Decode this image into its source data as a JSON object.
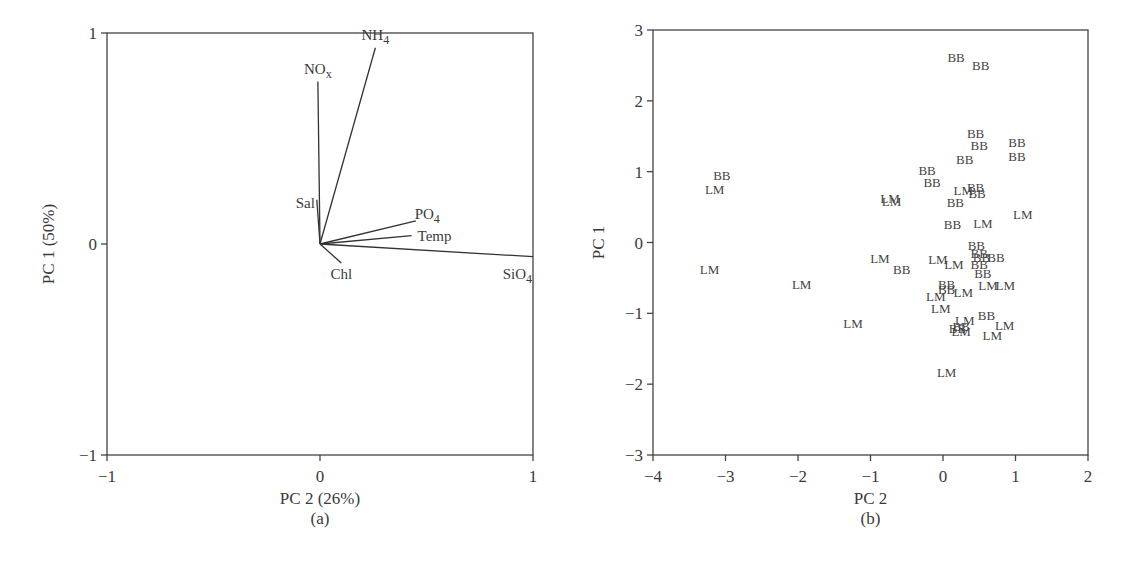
{
  "chart_data": [
    {
      "type": "biplot",
      "panel_label": "(a)",
      "xlabel": "PC 2 (26%)",
      "ylabel": "PC 1 (50%)",
      "xlim": [
        -1,
        1
      ],
      "ylim": [
        -1,
        1
      ],
      "xticks": [
        "-1",
        "0",
        "1"
      ],
      "yticks": [
        "1",
        "0",
        "-1"
      ],
      "grid": false,
      "legend": null,
      "vectors": [
        {
          "name": "NH4",
          "label": "NH",
          "sub": "4",
          "x": 0.26,
          "y": 0.93
        },
        {
          "name": "NOx",
          "label": "NO",
          "sub": "x",
          "x": -0.01,
          "y": 0.77
        },
        {
          "name": "Sal",
          "label": "Sal",
          "sub": "",
          "x": -0.015,
          "y": 0.21
        },
        {
          "name": "PO4",
          "label": "PO",
          "sub": "4",
          "x": 0.45,
          "y": 0.11
        },
        {
          "name": "Temp",
          "label": "Temp",
          "sub": "",
          "x": 0.43,
          "y": 0.04
        },
        {
          "name": "SiO4",
          "label": "SiO",
          "sub": "4",
          "x": 1.0,
          "y": -0.06
        },
        {
          "name": "Chl",
          "label": "Chl",
          "sub": "",
          "x": 0.1,
          "y": -0.09
        }
      ]
    },
    {
      "type": "scatter",
      "panel_label": "(b)",
      "xlabel": "PC 2",
      "ylabel": "PC 1",
      "xlim": [
        -4,
        2
      ],
      "ylim": [
        -3,
        3
      ],
      "xticks": [
        "-4",
        "-3",
        "-2",
        "-1",
        "0",
        "1",
        "2"
      ],
      "yticks": [
        "3",
        "2",
        "1",
        "0",
        "-1",
        "-2",
        "-3"
      ],
      "grid": false,
      "marker": "text-label",
      "series": [
        {
          "name": "BB",
          "points": [
            [
              0.18,
              2.62
            ],
            [
              0.52,
              2.5
            ],
            [
              0.45,
              1.55
            ],
            [
              0.5,
              1.38
            ],
            [
              1.02,
              1.42
            ],
            [
              1.02,
              1.22
            ],
            [
              0.3,
              1.18
            ],
            [
              -0.22,
              1.03
            ],
            [
              -0.15,
              0.85
            ],
            [
              0.45,
              0.78
            ],
            [
              0.47,
              0.7
            ],
            [
              0.17,
              0.57
            ],
            [
              -3.05,
              0.95
            ],
            [
              0.13,
              0.26
            ],
            [
              0.46,
              -0.03
            ],
            [
              0.5,
              -0.15
            ],
            [
              0.53,
              -0.2
            ],
            [
              0.73,
              -0.2
            ],
            [
              0.5,
              -0.3
            ],
            [
              0.55,
              -0.43
            ],
            [
              -0.57,
              -0.37
            ],
            [
              0.05,
              -0.58
            ],
            [
              0.05,
              -0.65
            ],
            [
              0.6,
              -1.02
            ],
            [
              0.25,
              -1.18
            ],
            [
              0.2,
              -1.2
            ]
          ]
        },
        {
          "name": "LM",
          "points": [
            [
              -3.15,
              0.75
            ],
            [
              -0.73,
              0.63
            ],
            [
              -0.71,
              0.58
            ],
            [
              0.28,
              0.74
            ],
            [
              0.55,
              0.28
            ],
            [
              1.1,
              0.4
            ],
            [
              -3.22,
              -0.37
            ],
            [
              -1.95,
              -0.58
            ],
            [
              -0.87,
              -0.22
            ],
            [
              -0.07,
              -0.23
            ],
            [
              0.15,
              -0.3
            ],
            [
              0.62,
              -0.6
            ],
            [
              0.86,
              -0.6
            ],
            [
              0.28,
              -0.7
            ],
            [
              -0.1,
              -0.75
            ],
            [
              -0.03,
              -0.92
            ],
            [
              0.3,
              -1.1
            ],
            [
              0.85,
              -1.16
            ],
            [
              0.25,
              -1.25
            ],
            [
              0.68,
              -1.3
            ],
            [
              -1.24,
              -1.13
            ],
            [
              0.05,
              -1.83
            ]
          ]
        }
      ]
    }
  ]
}
